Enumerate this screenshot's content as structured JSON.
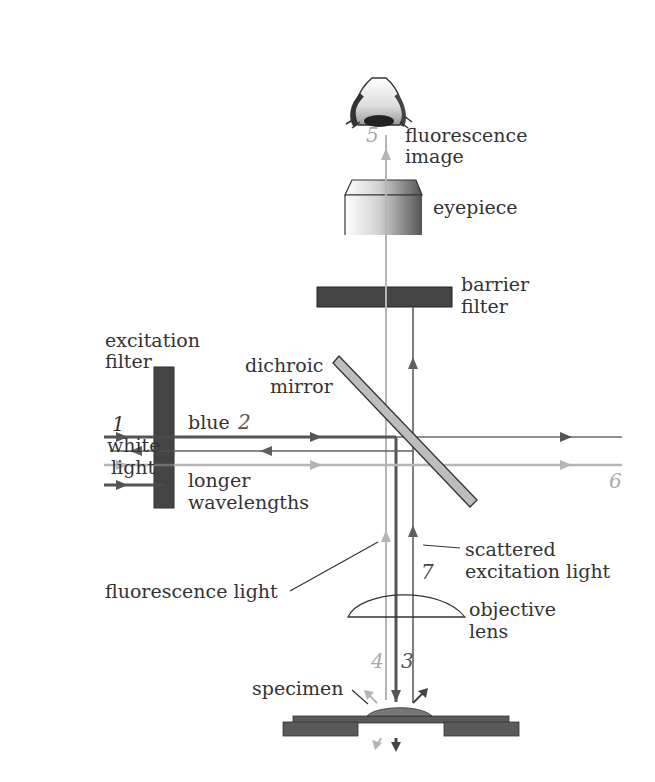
{
  "colors": {
    "dark_beam": "#555555",
    "mid_beam": "#6a6a6a",
    "light_beam": "#b5b5b5",
    "filter": "#444444",
    "mirror_fill": "#bdbdbd",
    "stage": "#5a5a5a",
    "specimen": "#777777",
    "label": "#333333",
    "number_light": "#aaaaaa",
    "number_dark": "#444444"
  },
  "labels": {
    "fluorescence_image_1": "fluorescence",
    "fluorescence_image_2": "image",
    "eyepiece": "eyepiece",
    "barrier_filter_1": "barrier",
    "barrier_filter_2": "filter",
    "excitation_filter_1": "excitation",
    "excitation_filter_2": "filter",
    "dichroic_mirror_1": "dichroic",
    "dichroic_mirror_2": "mirror",
    "white_light_1": "white",
    "white_light_2": "light",
    "blue": "blue",
    "longer_wavelengths_1": "longer",
    "longer_wavelengths_2": "wavelengths",
    "scattered_excitation_1": "scattered",
    "scattered_excitation_2": "excitation light",
    "fluorescence_light": "fluorescence light",
    "objective_lens_1": "objective",
    "objective_lens_2": "lens",
    "specimen": "specimen"
  },
  "numbers": {
    "n1": "1",
    "n2": "2",
    "n3": "3",
    "n4": "4",
    "n5": "5",
    "n6": "6",
    "n7": "7"
  }
}
